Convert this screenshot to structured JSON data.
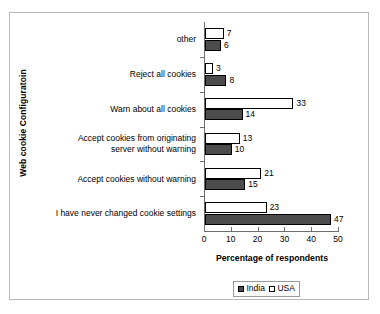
{
  "chart_data": {
    "type": "bar",
    "orientation": "horizontal",
    "title": "",
    "xlabel": "Percentage of respondents",
    "ylabel": "Web cookie Configuratoin",
    "xlim": [
      0,
      50
    ],
    "xticks": [
      0,
      10,
      20,
      30,
      40,
      50
    ],
    "grid": false,
    "legend_position": "bottom",
    "categories": [
      "other",
      "Reject all cookies",
      "Warn about all cookies",
      "Accept cookies from originating server without warning",
      "Accept cookies without warning",
      "I have never changed cookie settings"
    ],
    "category_lines": [
      [
        "other"
      ],
      [
        "Reject all cookies"
      ],
      [
        "Warn about all cookies"
      ],
      [
        "Accept cookies from originating",
        "server without warning"
      ],
      [
        "Accept cookies without warning"
      ],
      [
        "I have never changed cookie settings"
      ]
    ],
    "series": [
      {
        "name": "India",
        "color": "#4c4c4c",
        "values": [
          6,
          8,
          14,
          10,
          15,
          47
        ]
      },
      {
        "name": "USA",
        "color": "#ffffff",
        "values": [
          7,
          3,
          33,
          13,
          21,
          23
        ]
      }
    ]
  },
  "legend": {
    "entries": [
      {
        "label": "India"
      },
      {
        "label": "USA"
      }
    ]
  }
}
